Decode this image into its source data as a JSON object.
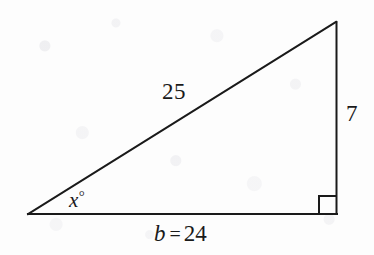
{
  "figure": {
    "kind": "right-triangle-diagram",
    "background_color": "#fdfdfd",
    "stroke_color": "#1a1a1a",
    "stroke_width": 2,
    "geometry": {
      "vertices": {
        "left": {
          "x": 28,
          "y": 214
        },
        "bottom_right": {
          "x": 337,
          "y": 214
        },
        "apex": {
          "x": 336,
          "y": 22
        }
      },
      "right_angle_marker": {
        "corner": "bottom-right",
        "size": 17,
        "inset_x": 18,
        "inset_y": 18
      }
    },
    "labels": {
      "hypotenuse": "25",
      "opposite_leg": "7",
      "angle_variable": "x",
      "angle_degree_symbol": "°",
      "base_variable": "b",
      "base_equals": "=",
      "base_value": "24"
    }
  }
}
